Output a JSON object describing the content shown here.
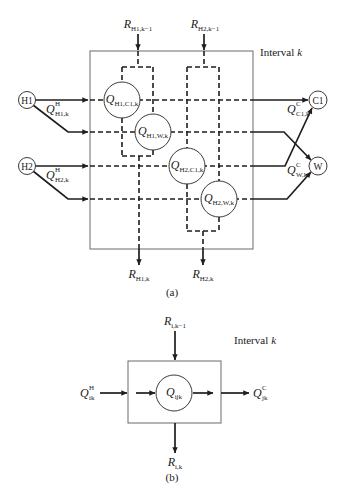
{
  "figure_a": {
    "interval": {
      "text": "Interval",
      "var": "k"
    },
    "residuals_in": [
      {
        "main": "R",
        "sub": "H1,k−1"
      },
      {
        "main": "R",
        "sub": "H2,k−1"
      }
    ],
    "residuals_out": [
      {
        "main": "R",
        "sub": "H1,k"
      },
      {
        "main": "R",
        "sub": "H2,k"
      }
    ],
    "hot_streams": [
      {
        "label": "H1"
      },
      {
        "label": "H2"
      }
    ],
    "cold_streams": [
      {
        "label": "C1"
      },
      {
        "label": "W"
      }
    ],
    "hot_loads": [
      {
        "main": "Q",
        "sup": "H",
        "sub": "H1,k"
      },
      {
        "main": "Q",
        "sup": "H",
        "sub": "H2,k"
      }
    ],
    "cold_loads": [
      {
        "main": "Q",
        "sup": "C",
        "sub": "C1,k"
      },
      {
        "main": "Q",
        "sup": "C",
        "sub": "W,k"
      }
    ],
    "exchanges": [
      {
        "main": "Q",
        "sub": "H1,C1,k"
      },
      {
        "main": "Q",
        "sub": "H1,W,k"
      },
      {
        "main": "Q",
        "sub": "H2,C1,k"
      },
      {
        "main": "Q",
        "sub": "H2,W,k"
      }
    ],
    "caption": "(a)"
  },
  "figure_b": {
    "interval": {
      "text": "Interval",
      "var": "k"
    },
    "residual_in": {
      "main": "R",
      "sub": "i,k−1"
    },
    "residual_out": {
      "main": "R",
      "sub": "i,k"
    },
    "hot_load": {
      "main": "Q",
      "sup": "H",
      "sub": "ik"
    },
    "cold_load": {
      "main": "Q",
      "sup": "C",
      "sub": "jk"
    },
    "exchange": {
      "main": "Q",
      "sub": "ijk"
    },
    "caption": "(b)"
  }
}
